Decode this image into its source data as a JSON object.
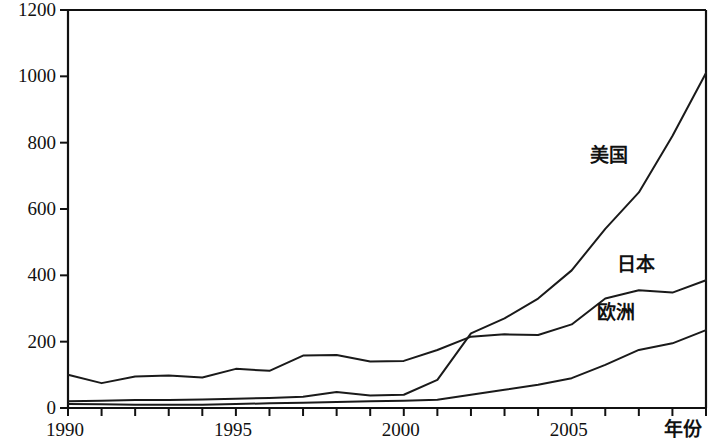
{
  "chart_data": {
    "type": "line",
    "title": "",
    "subtitle": "",
    "xlabel": "年份",
    "ylabel": "",
    "xlim": [
      1990,
      2009
    ],
    "ylim": [
      0,
      1200
    ],
    "grid": false,
    "legend_position": "inline-right",
    "x": [
      1990,
      1991,
      1992,
      1993,
      1994,
      1995,
      1996,
      1997,
      1998,
      1999,
      2000,
      2001,
      2002,
      2003,
      2004,
      2005,
      2006,
      2007,
      2008,
      2009
    ],
    "xticks": [
      1990,
      1995,
      2000,
      2005
    ],
    "xtick_labels": [
      "1990",
      "1995",
      "2000",
      "2005"
    ],
    "yticks": [
      0,
      200,
      400,
      600,
      800,
      1000,
      1200
    ],
    "ytick_labels": [
      "0",
      "200",
      "400",
      "600",
      "800",
      "1000",
      "1200"
    ],
    "series": [
      {
        "name": "美国",
        "label": "美国",
        "color": "#1a1a1a",
        "values": [
          20,
          22,
          24,
          24,
          26,
          28,
          30,
          34,
          48,
          38,
          40,
          85,
          225,
          270,
          330,
          415,
          540,
          650,
          820,
          1010
        ]
      },
      {
        "name": "日本",
        "label": "日本",
        "color": "#1a1a1a",
        "values": [
          100,
          75,
          95,
          98,
          92,
          118,
          112,
          158,
          160,
          140,
          142,
          175,
          215,
          222,
          220,
          252,
          330,
          355,
          348,
          385
        ]
      },
      {
        "name": "欧洲",
        "label": "欧洲",
        "color": "#1a1a1a",
        "values": [
          12,
          11,
          10,
          10,
          10,
          12,
          14,
          16,
          18,
          20,
          22,
          25,
          40,
          55,
          70,
          90,
          130,
          175,
          195,
          235
        ]
      }
    ],
    "annotations": [
      {
        "text": "美国",
        "x": 2006.2,
        "y": 760
      },
      {
        "text": "日本",
        "x": 2007.0,
        "y": 430
      },
      {
        "text": "欧洲",
        "x": 2006.4,
        "y": 285
      }
    ]
  },
  "axis": {
    "x_title": "年份"
  }
}
